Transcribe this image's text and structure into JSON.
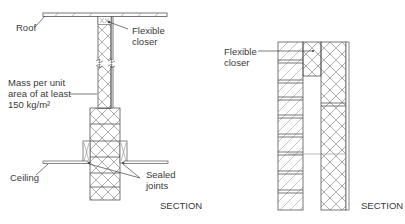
{
  "left_diagram": {
    "labels": {
      "roof": "Roof",
      "flexible_closer": "Flexible\ncloser",
      "mass": "Mass per unit\narea of at least\n150 kg/m²",
      "ceiling": "Ceiling",
      "sealed_joints": "Sealed\njoints",
      "section": "SECTION"
    }
  },
  "right_diagram": {
    "labels": {
      "flexible_closer": "Flexible\ncloser",
      "section": "SECTION"
    }
  },
  "colors": {
    "line": "#555555",
    "text": "#3a3a3a",
    "background": "#ffffff"
  }
}
